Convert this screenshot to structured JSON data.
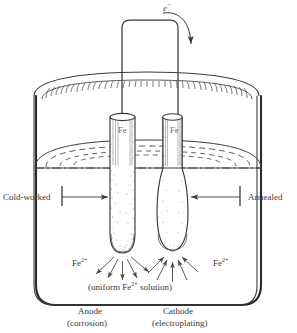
{
  "figure": {
    "type": "scientific-diagram",
    "background_color": "#ffffff",
    "ink_color": "#3a3a3a",
    "stipple_color": "#6c6c6c"
  },
  "labels": {
    "electron": "e",
    "electron_sup": "−",
    "electrode_left": "Fe",
    "electrode_right": "Fe",
    "cold_worked": "Cold-worked",
    "annealed": "Annealed",
    "ion_left": "Fe",
    "ion_left_sup": "2+",
    "ion_right": "Fe",
    "ion_right_sup": "2+",
    "solution_pre": "(uniform Fe",
    "solution_sup": "2+",
    "solution_post": " solution)",
    "anode": "Anode",
    "anode_sub": "(corrosion)",
    "cathode": "Cathode",
    "cathode_sub": "(electroplating)"
  },
  "elements": {
    "beaker": "glass beaker containing solution",
    "wire": "external conducting wire joining the two electrodes",
    "electron_arrow": "curved arrow showing electron flow direction into cathode",
    "liquid_surface": "dashed ellipse marking the solution surface",
    "anode_electrode": "narrow cold-worked iron rod (dissolving)",
    "cathode_electrode": "thickened annealed iron rod (plated)",
    "anode_arrows": "arrows radiating outward from anode tip",
    "cathode_arrows": "arrows converging inward to cathode tip"
  }
}
